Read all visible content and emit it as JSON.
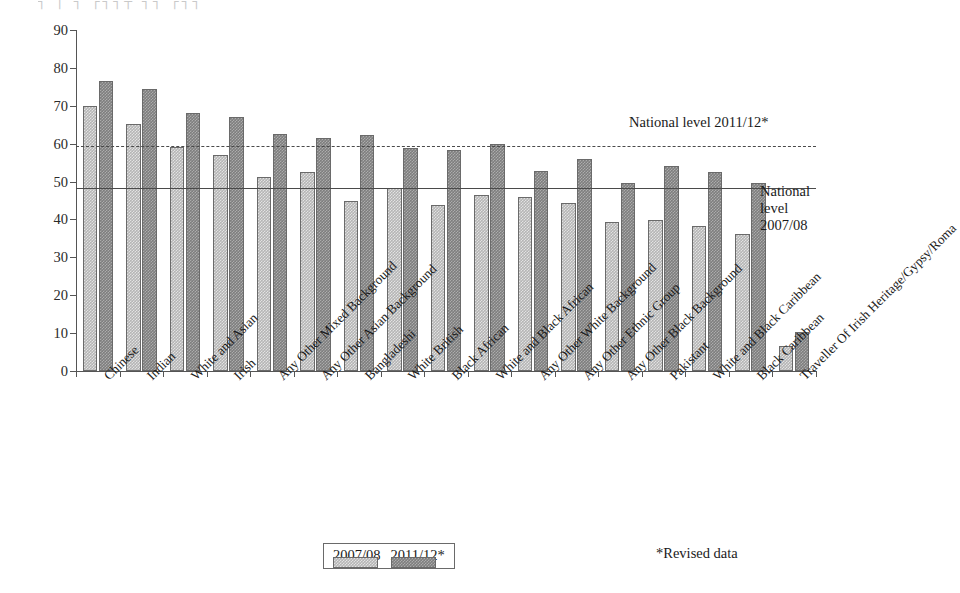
{
  "top_artifact": "┐  │   ┐ ┌┐┐┬  ┐┐  ┌┐┐",
  "chart_data": {
    "type": "bar",
    "title": "",
    "xlabel": "",
    "ylabel": "Percentage of pupils",
    "ylim": [
      0,
      90
    ],
    "ytick_step": 10,
    "yticks": [
      0,
      10,
      20,
      30,
      40,
      50,
      60,
      70,
      80,
      90
    ],
    "grid": false,
    "legend_position": "bottom",
    "categories": [
      "Chinese",
      "Indian",
      "White and Asian",
      "Irish",
      "Any Other Mixed Background",
      "Any Other Asian Background",
      "Bangladeshi",
      "White British",
      "Black African",
      "White and Black African",
      "Any Other White Background",
      "Any Other Ethnic Group",
      "Any Other Black Background",
      "Pakistant",
      "White and Black Caribbean",
      "Black Caribbean",
      "Traveller Of Irish Heritage/Gypsy/Roma"
    ],
    "series": [
      {
        "name": "2007/08",
        "color": "#b5b5b5",
        "values": [
          70.0,
          65.2,
          59.0,
          57.0,
          51.2,
          52.4,
          44.8,
          48.2,
          43.8,
          46.4,
          46.0,
          44.3,
          39.4,
          39.9,
          38.2,
          36.1,
          6.5
        ]
      },
      {
        "name": "2011/12*",
        "color": "#7e7e7e",
        "values": [
          76.5,
          74.5,
          68.0,
          67.0,
          62.5,
          61.6,
          62.4,
          58.9,
          58.3,
          60.0,
          52.8,
          56.0,
          49.7,
          54.2,
          52.4,
          49.5,
          10.3
        ]
      }
    ],
    "reference_lines": [
      {
        "id": "national-2011-12",
        "value": 59.4,
        "style": "dashed",
        "label": "National level 2011/12*"
      },
      {
        "id": "national-2007-08",
        "value": 48.3,
        "style": "solid",
        "label_lines": [
          "National",
          "level",
          "2007/08"
        ]
      }
    ],
    "annotations": {
      "national_2011_12": "National level 2011/12*",
      "national_2007_08_l1": "National",
      "national_2007_08_l2": "level",
      "national_2007_08_l3": "2007/08",
      "footnote": "*Revised data"
    },
    "legend": [
      {
        "label": "2007/08",
        "color": "#b5b5b5"
      },
      {
        "label": "2011/12*",
        "color": "#7e7e7e"
      }
    ]
  }
}
